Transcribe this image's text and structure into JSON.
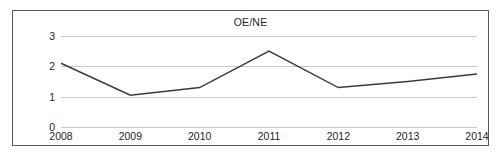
{
  "chart_data": {
    "type": "line",
    "title": "OE/NE",
    "xlabel": "",
    "ylabel": "",
    "categories": [
      "2008",
      "2009",
      "2010",
      "2011",
      "2012",
      "2013",
      "2014"
    ],
    "values": [
      2.1,
      1.05,
      1.3,
      2.5,
      1.3,
      1.5,
      1.75
    ],
    "series": [
      {
        "name": "OE/NE",
        "values": [
          2.1,
          1.05,
          1.3,
          2.5,
          1.3,
          1.5,
          1.75
        ]
      }
    ],
    "ylim": [
      0,
      3
    ],
    "yticks": [
      0,
      1,
      2,
      3
    ],
    "ytick_labels": [
      "0",
      "1",
      "2",
      "3"
    ],
    "grid": true,
    "grid_axis": "y",
    "legend": false,
    "legend_position": "none",
    "markers": false,
    "line_color": "#3b3b3d",
    "grid_color": "#c9cacc",
    "frame_color": "#58585a",
    "background_color": "#ffffff",
    "text_color": "#231f20"
  }
}
